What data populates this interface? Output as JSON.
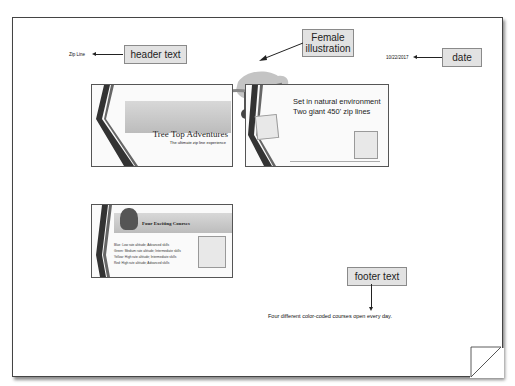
{
  "page": {
    "header_text": "Zip Line",
    "date": "10/22/2017",
    "footer_text": "Four different color-coded courses open every day."
  },
  "callouts": {
    "header": "header text",
    "female": "Female illustration",
    "date": "date",
    "footer": "footer text"
  },
  "slides": [
    {
      "title": "Tree Top Adventures",
      "subtitle": "The ultimate zip line experience"
    },
    {
      "line1": "Set in natural environment",
      "line2": "Two giant 450' zip lines"
    },
    {
      "title": "Four Exciting Courses",
      "bullets": [
        "Blue: Low rate altitude; Advanced skills",
        "Green: Medium rate altitude; Intermediate skills",
        "Yellow: High rate altitude; Intermediate skills",
        "Red: High rate altitude; Advanced skills"
      ]
    }
  ],
  "colors": {
    "callout_bg": "#e2e2e2",
    "stripe": "#333333",
    "band": "#c8c8c8"
  }
}
